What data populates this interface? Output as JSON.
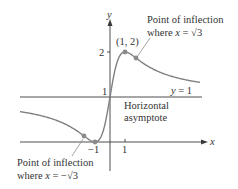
{
  "figure": {
    "function": "f(x) = 1 + 2x/(1+x^2)",
    "axes": {
      "x_label": "x",
      "y_label": "y",
      "x_ticks": [
        {
          "value": -1,
          "label": "−1"
        },
        {
          "value": 1,
          "label": "1"
        }
      ],
      "y_ticks": [
        {
          "value": 1,
          "label": "1"
        },
        {
          "value": 2,
          "label": "2"
        }
      ]
    },
    "asymptote": {
      "equation": "y = 1",
      "label_line1": "Horizontal",
      "label_line2": "asymptote"
    },
    "points": [
      {
        "name": "local-max",
        "x": 1,
        "y": 2,
        "label": "(1, 2)"
      },
      {
        "name": "local-min",
        "x": -1,
        "y": 0,
        "label": ""
      },
      {
        "name": "inflection-positive",
        "x": 1.732,
        "y": 1.866,
        "label": ""
      },
      {
        "name": "inflection-negative",
        "x": -1.732,
        "y": 0.134,
        "label": ""
      }
    ],
    "annotations": {
      "upper": {
        "line1": "Point of inflection",
        "line2_prefix": "where ",
        "line2_var": "x",
        "line2_eq": " = √3"
      },
      "lower": {
        "line1": "Point of inflection",
        "line2_prefix": "where ",
        "line2_var": "x",
        "line2_eq": " = −√3"
      }
    },
    "colors": {
      "axis": "#3a3a3a",
      "curve": "#808080",
      "point": "#8a8a8a",
      "text": "#333333"
    }
  },
  "chart_data": {
    "type": "line",
    "title": "",
    "xlabel": "x",
    "ylabel": "y",
    "xlim": [
      -6,
      6
    ],
    "ylim": [
      -0.6,
      2.7
    ],
    "series": [
      {
        "name": "y = 1 + 2x/(1+x^2)",
        "x": [
          -6,
          -5,
          -4,
          -3,
          -2,
          -1.732,
          -1,
          -0.5,
          0,
          0.5,
          1,
          1.732,
          2,
          3,
          4,
          5,
          6
        ],
        "y": [
          0.676,
          0.615,
          0.529,
          0.4,
          0.2,
          0.134,
          0,
          0.2,
          1,
          1.8,
          2,
          1.866,
          1.8,
          1.6,
          1.471,
          1.385,
          1.324
        ]
      },
      {
        "name": "asymptote y = 1",
        "x": [
          -6,
          6
        ],
        "y": [
          1,
          1
        ]
      }
    ],
    "annotations": [
      "(1, 2)",
      "Point of inflection where x = √3",
      "Point of inflection where x = −√3",
      "Horizontal asymptote",
      "y = 1"
    ]
  }
}
